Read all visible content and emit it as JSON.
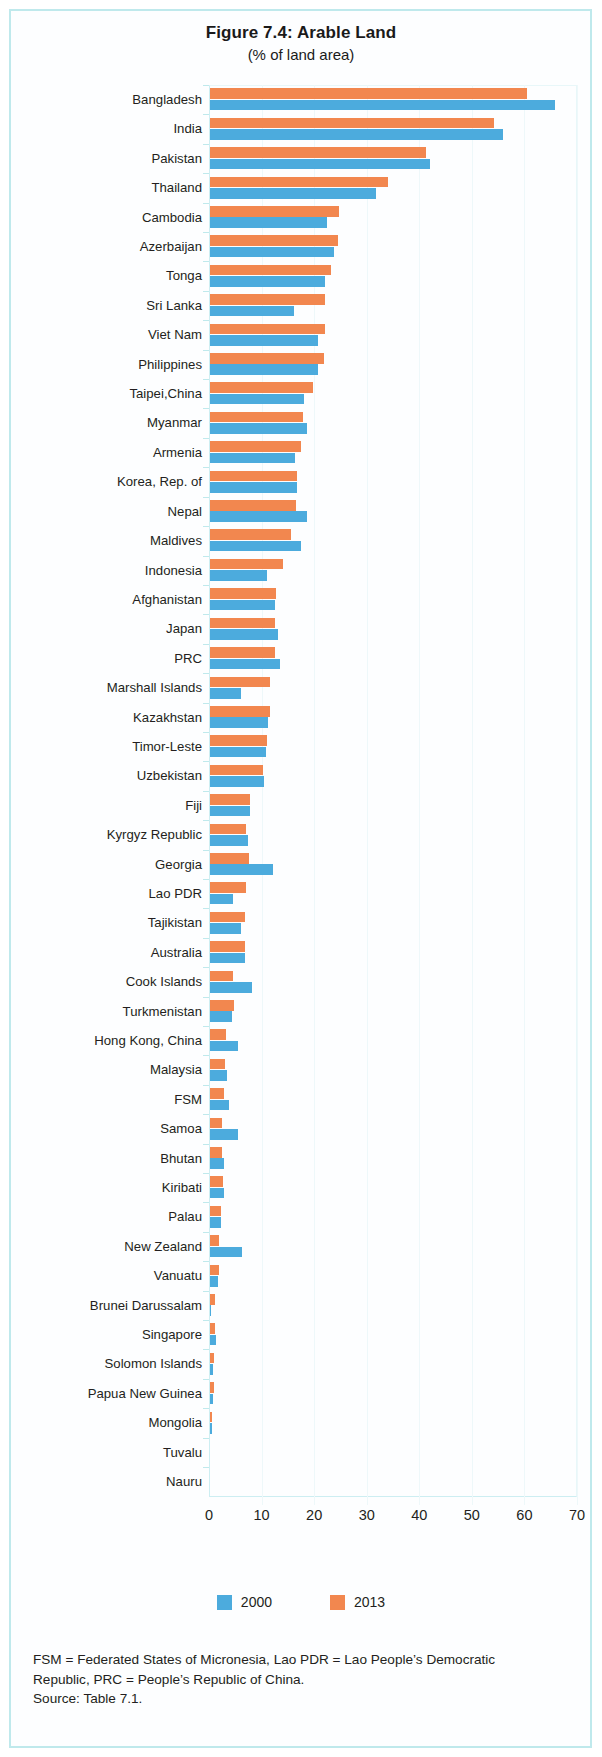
{
  "figure": {
    "title": "Figure 7.4:  Arable Land",
    "subtitle": "(% of land area)"
  },
  "legend": {
    "items": [
      {
        "label": "2000",
        "color": "#4cabdd"
      },
      {
        "label": "2013",
        "color": "#f2874f"
      }
    ]
  },
  "footnote": {
    "line1": "FSM = Federated States of Micronesia, Lao PDR = Lao People’s Democratic",
    "line2": "Republic, PRC = People’s Republic of China.",
    "line3": "Source: Table 7.1."
  },
  "chart_data": {
    "type": "bar",
    "orientation": "horizontal",
    "title": "Figure 7.4:  Arable Land",
    "subtitle": "(% of land area)",
    "xlabel": "",
    "ylabel": "",
    "xlim": [
      0,
      70
    ],
    "xticks": [
      0,
      10,
      20,
      30,
      40,
      50,
      60,
      70
    ],
    "grid": true,
    "legend_position": "bottom",
    "categories": [
      "Bangladesh",
      "India",
      "Pakistan",
      "Thailand",
      "Cambodia",
      "Azerbaijan",
      "Tonga",
      "Sri Lanka",
      "Viet Nam",
      "Philippines",
      "Taipei,China",
      "Myanmar",
      "Armenia",
      "Korea, Rep. of",
      "Nepal",
      "Maldives",
      "Indonesia",
      "Afghanistan",
      "Japan",
      "PRC",
      "Marshall Islands",
      "Kazakhstan",
      "Timor-Leste",
      "Uzbekistan",
      "Fiji",
      "Kyrgyz Republic",
      "Georgia",
      "Lao PDR",
      "Tajikistan",
      "Australia",
      "Cook Islands",
      "Turkmenistan",
      "Hong Kong, China",
      "Malaysia",
      "FSM",
      "Samoa",
      "Bhutan",
      "Kiribati",
      "Palau",
      "New Zealand",
      "Vanuatu",
      "Brunei Darussalam",
      "Singapore",
      "Solomon Islands",
      "Papua New Guinea",
      "Mongolia",
      "Tuvalu",
      "Nauru"
    ],
    "series": [
      {
        "name": "2000",
        "color": "#4cabdd",
        "values": [
          65.6,
          55.7,
          41.8,
          31.5,
          22.2,
          23.6,
          21.9,
          16.0,
          20.5,
          20.6,
          17.9,
          18.5,
          16.1,
          16.6,
          18.5,
          17.4,
          10.9,
          12.3,
          13.0,
          13.4,
          5.9,
          11.0,
          10.7,
          10.2,
          7.7,
          7.2,
          12.0,
          4.4,
          5.9,
          6.6,
          8.0,
          4.2,
          5.3,
          3.2,
          3.7,
          5.3,
          2.6,
          2.7,
          2.1,
          6.1,
          1.6,
          0.2,
          1.1,
          0.6,
          0.5,
          0.4,
          0.0,
          0.0
        ]
      },
      {
        "name": "2013",
        "color": "#f2874f",
        "values": [
          60.3,
          54.0,
          41.1,
          33.8,
          24.5,
          24.4,
          23.1,
          21.9,
          21.9,
          21.6,
          19.6,
          17.6,
          17.4,
          16.6,
          16.3,
          15.5,
          13.9,
          12.6,
          12.4,
          12.3,
          11.5,
          11.4,
          10.9,
          10.0,
          7.7,
          6.9,
          7.4,
          6.9,
          6.6,
          6.6,
          4.4,
          4.5,
          3.1,
          2.9,
          2.6,
          2.3,
          2.3,
          2.5,
          2.1,
          1.8,
          1.7,
          0.9,
          1.0,
          0.7,
          0.7,
          0.4,
          0.0,
          0.0
        ]
      }
    ]
  }
}
